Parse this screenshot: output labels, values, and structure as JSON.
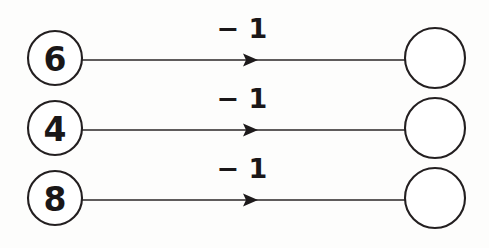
{
  "diagram": {
    "background_color": "#fdfdfc",
    "stroke_color": "#231f20",
    "text_color": "#1a1718",
    "rows": [
      {
        "input_label": "6",
        "operation_label": "− 1",
        "output_label": "",
        "input_cx": 55,
        "input_cy": 58,
        "input_r": 27,
        "output_cx": 435,
        "output_cy": 58,
        "output_r": 30,
        "line_y": 60,
        "line_x1": 82,
        "line_x2": 405,
        "arrow_x": 253,
        "op_x": 242,
        "op_y": 38
      },
      {
        "input_label": "4",
        "operation_label": "− 1",
        "output_label": "",
        "input_cx": 55,
        "input_cy": 128,
        "input_r": 27,
        "output_cx": 435,
        "output_cy": 128,
        "output_r": 30,
        "line_y": 130,
        "line_x1": 82,
        "line_x2": 405,
        "arrow_x": 253,
        "op_x": 242,
        "op_y": 108
      },
      {
        "input_label": "8",
        "operation_label": "− 1",
        "output_label": "",
        "input_cx": 55,
        "input_cy": 198,
        "input_r": 27,
        "output_cx": 435,
        "output_cy": 198,
        "output_r": 30,
        "line_y": 200,
        "line_x1": 82,
        "line_x2": 405,
        "arrow_x": 253,
        "op_x": 242,
        "op_y": 178
      }
    ]
  },
  "artifacts": {
    "bleed_1": "",
    "bleed_2": "",
    "bleed_3": ""
  }
}
